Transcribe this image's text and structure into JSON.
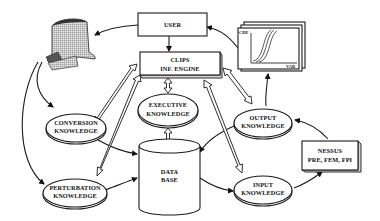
{
  "diagram": {
    "nodes": {
      "user": {
        "label": "USER"
      },
      "clips": {
        "line1": "CLIPS",
        "line2": "INF. ENGINE"
      },
      "executive": {
        "line1": "EXECUTIVE",
        "line2": "KNOWLEDGE"
      },
      "database": {
        "line1": "DATA",
        "line2": "BASE"
      },
      "conversion": {
        "line1": "CONVERSION",
        "line2": "KNOWLEDGE"
      },
      "perturbation": {
        "line1": "PERTURBATION",
        "line2": "KNOWLEDGE"
      },
      "output": {
        "line1": "OUTPUT",
        "line2": "KNOWLEDGE"
      },
      "input": {
        "line1": "INPUT",
        "line2": "KNOWLEDGE"
      },
      "nessus": {
        "line1": "NESSUS",
        "line2": "PRE, FEM, FPI"
      },
      "cdf_plot": {
        "ylabel": "CDF",
        "xlabel": "VAR"
      },
      "turbine_blade": {
        "label": ""
      }
    },
    "edges": [
      {
        "from": "user",
        "to": "clips",
        "style": "single"
      },
      {
        "from": "user",
        "to": "turbine_blade",
        "style": "single"
      },
      {
        "from": "cdf_plot",
        "to": "user",
        "style": "single"
      },
      {
        "from": "turbine_blade",
        "to": "conversion",
        "style": "single"
      },
      {
        "from": "turbine_blade",
        "to": "perturbation",
        "style": "single"
      },
      {
        "from": "conversion",
        "to": "database",
        "style": "single"
      },
      {
        "from": "perturbation",
        "to": "database",
        "style": "single"
      },
      {
        "from": "clips",
        "to": "executive",
        "style": "double-bidirectional"
      },
      {
        "from": "executive",
        "to": "database",
        "style": "double-bidirectional"
      },
      {
        "from": "clips",
        "to": "conversion",
        "style": "double-bidirectional"
      },
      {
        "from": "clips",
        "to": "perturbation",
        "style": "double-bidirectional"
      },
      {
        "from": "clips",
        "to": "output",
        "style": "double-bidirectional"
      },
      {
        "from": "clips",
        "to": "input",
        "style": "double-bidirectional"
      },
      {
        "from": "output",
        "to": "cdf_plot",
        "style": "single"
      },
      {
        "from": "output",
        "to": "database",
        "style": "single"
      },
      {
        "from": "database",
        "to": "input",
        "style": "single"
      },
      {
        "from": "input",
        "to": "nessus",
        "style": "single"
      },
      {
        "from": "nessus",
        "to": "output",
        "style": "single"
      }
    ]
  }
}
